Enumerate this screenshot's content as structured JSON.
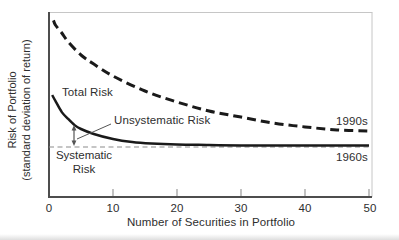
{
  "figure": {
    "y_axis_label_line1": "Risk of Portfolio",
    "y_axis_label_line2": "(standard deviation of return)",
    "x_axis_label": "Number of Securities in Portfolio",
    "tick_labels": [
      "0",
      "10",
      "20",
      "30",
      "40",
      "50"
    ],
    "labels": {
      "total_risk": "Total Risk",
      "unsystematic_risk": "Unsystematic Risk",
      "systematic_risk": "Systematic Risk",
      "era_top": "1990s",
      "era_bottom": "1960s"
    },
    "colors": {
      "curve": "#1a1a1a",
      "axis": "#4d4d4d",
      "frame": "#c6c6c6",
      "systematic_line": "#8c8c8c",
      "tick": "#9a9a9a",
      "text": "#2e2e2e",
      "annotation": "#555555",
      "background": "#ffffff"
    }
  },
  "chart_data": {
    "type": "line",
    "xlabel": "Number of Securities in Portfolio",
    "ylabel": "Risk of Portfolio (standard deviation of return)",
    "xlim": [
      0,
      50
    ],
    "ylim": [
      0,
      10
    ],
    "x_ticks": [
      0,
      10,
      20,
      30,
      40,
      50
    ],
    "y_units": "arbitrary (no numeric y scale shown)",
    "grid": false,
    "legend": "inline curve labels",
    "series": [
      {
        "name": "Total Risk — 1990s",
        "label": "1990s",
        "style": "bold-dashed",
        "x": [
          0.7,
          1,
          2,
          3,
          5,
          7,
          10,
          15,
          20,
          25,
          30,
          35,
          40,
          45,
          50
        ],
        "values": [
          9.55,
          9.3,
          8.87,
          8.39,
          7.69,
          7.2,
          6.56,
          5.75,
          5.16,
          4.68,
          4.35,
          4.03,
          3.82,
          3.66,
          3.6
        ]
      },
      {
        "name": "Total Risk",
        "label": "Total Risk",
        "style": "solid",
        "x": [
          0.5,
          1,
          2,
          3,
          4,
          5,
          7,
          10,
          13,
          16,
          20,
          25,
          30,
          40,
          50
        ],
        "values": [
          5.54,
          5.22,
          4.62,
          4.25,
          3.92,
          3.71,
          3.44,
          3.17,
          3.01,
          2.93,
          2.88,
          2.85,
          2.83,
          2.82,
          2.82
        ]
      },
      {
        "name": "Systematic Risk — 1960s level",
        "label": "1960s",
        "style": "thin-dashed-horizontal",
        "constant_value": 2.74
      }
    ],
    "annotations": [
      "Unsystematic Risk = gap between Total Risk curve and Systematic Risk line (double arrow near x=4)",
      "Systematic Risk label below horizontal dashed line"
    ]
  }
}
